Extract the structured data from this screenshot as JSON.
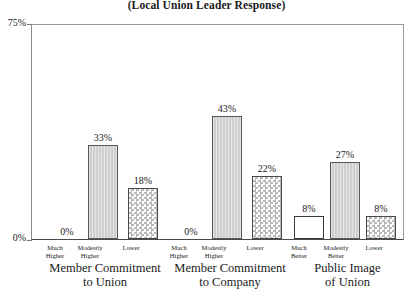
{
  "chart_data": {
    "type": "bar",
    "title": "(Local Union Leader Response)",
    "xlabel": "",
    "ylabel": "",
    "ylim": [
      0,
      75
    ],
    "ytick_labels": [
      "0%",
      "75%"
    ],
    "grid": false,
    "legend": "none",
    "categories": [
      "Much Higher",
      "Modestly Higher",
      "Lower"
    ],
    "groups": [
      {
        "name": "Member Commitment to Union",
        "title_line1": "Member Commitment",
        "title_line2": "to Union",
        "bars": [
          {
            "category_line1": "Much",
            "category_line2": "Higher",
            "value": 0,
            "label": "0%",
            "fill": "plain"
          },
          {
            "category_line1": "Modestly",
            "category_line2": "Higher",
            "value": 33,
            "label": "33%",
            "fill": "solid"
          },
          {
            "category_line1": "Lower",
            "category_line2": "",
            "value": 18,
            "label": "18%",
            "fill": "hatch"
          }
        ]
      },
      {
        "name": "Member Commitment to Company",
        "title_line1": "Member Commitment",
        "title_line2": "to Company",
        "bars": [
          {
            "category_line1": "Much",
            "category_line2": "Higher",
            "value": 0,
            "label": "0%",
            "fill": "plain"
          },
          {
            "category_line1": "Modestly",
            "category_line2": "Higher",
            "value": 43,
            "label": "43%",
            "fill": "solid"
          },
          {
            "category_line1": "Lower",
            "category_line2": "",
            "value": 22,
            "label": "22%",
            "fill": "hatch"
          }
        ]
      },
      {
        "name": "Public Image of Union",
        "title_line1": "Public Image",
        "title_line2": "of Union",
        "bars": [
          {
            "category_line1": "Much",
            "category_line2": "Better",
            "value": 8,
            "label": "8%",
            "fill": "plain"
          },
          {
            "category_line1": "Modestly",
            "category_line2": "Better",
            "value": 27,
            "label": "27%",
            "fill": "solid"
          },
          {
            "category_line1": "Lower",
            "category_line2": "",
            "value": 8,
            "label": "8%",
            "fill": "hatch"
          }
        ]
      }
    ],
    "colors": {
      "bar_solid": "#cfcfcf",
      "bar_hatch": "#b9b9b9",
      "bar_plain": "#ffffff",
      "outline": "#3d3d3d",
      "text": "#1a1a1a"
    }
  }
}
